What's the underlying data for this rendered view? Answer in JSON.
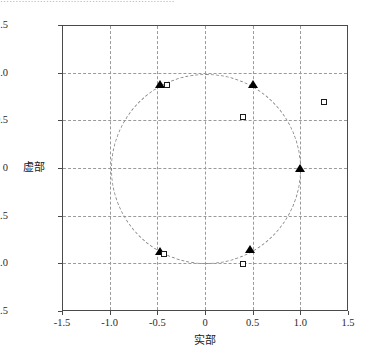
{
  "caption_sliver": "…………………………………………………",
  "chart_data": {
    "type": "scatter",
    "title": "",
    "xlabel": "实部",
    "ylabel": "虚部",
    "xlim": [
      -1.5,
      1.5
    ],
    "ylim": [
      -1.5,
      1.5
    ],
    "xticks": [
      "-1.5",
      "-1.0",
      "-0.5",
      "0",
      "0.5",
      "1.0",
      "1.5"
    ],
    "xtick_values": [
      -1.5,
      -1.0,
      -0.5,
      0,
      0.5,
      1.0,
      1.5
    ],
    "yticks": [
      "1.5",
      "1.0",
      "0.5",
      "0",
      "-0.5",
      "-1.0",
      "-1.5"
    ],
    "ytick_values": [
      1.5,
      1.0,
      0.5,
      0,
      -0.5,
      -1.0,
      -1.5
    ],
    "grid": true,
    "grid_style": "dashed",
    "legend": null,
    "annotations": [
      {
        "name": "unit-circle",
        "shape": "circle",
        "center": [
          0,
          0
        ],
        "radius": 1.0,
        "style": "dashed"
      }
    ],
    "series": [
      {
        "name": "zeros",
        "marker": "triangle-filled",
        "color": "#000000",
        "points": [
          [
            -0.47,
            0.88
          ],
          [
            0.5,
            0.88
          ],
          [
            1.0,
            0.0
          ],
          [
            0.47,
            -0.86
          ],
          [
            -0.47,
            -0.88
          ]
        ]
      },
      {
        "name": "poles",
        "marker": "square-open",
        "color": "#1a1a1a",
        "points": [
          [
            -0.4,
            0.87
          ],
          [
            0.4,
            0.53
          ],
          [
            1.25,
            0.69
          ],
          [
            0.4,
            -1.01
          ],
          [
            -0.43,
            -0.9
          ]
        ]
      }
    ]
  }
}
